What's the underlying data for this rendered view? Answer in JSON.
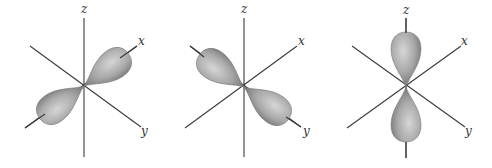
{
  "figure": {
    "colors": {
      "axis": "#3a3a3a",
      "lobe_dark": "#6e6e6e",
      "lobe_light": "#d0d0d0",
      "background": "#ffffff"
    },
    "panels": [
      {
        "name": "px",
        "orbital_axis": "x",
        "labels": {
          "z": "z",
          "x": "x",
          "y": "y"
        }
      },
      {
        "name": "py",
        "orbital_axis": "y",
        "labels": {
          "z": "z",
          "x": "x",
          "y": "y"
        }
      },
      {
        "name": "pz",
        "orbital_axis": "z",
        "labels": {
          "z": "z",
          "x": "x",
          "y": "y"
        }
      }
    ]
  }
}
